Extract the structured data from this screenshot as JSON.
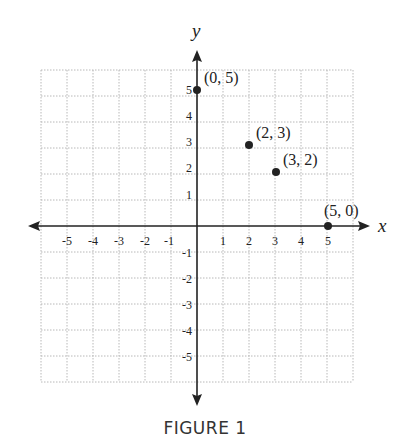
{
  "figure": {
    "caption": "FIGURE 1"
  },
  "axes": {
    "x_label": "x",
    "y_label": "y",
    "x_ticks": [
      "-5",
      "-4",
      "-3",
      "-2",
      "-1",
      "1",
      "2",
      "3",
      "4",
      "5"
    ],
    "y_ticks": [
      "5",
      "4",
      "3",
      "2",
      "1",
      "-1",
      "-2",
      "-3",
      "-4",
      "-5"
    ]
  },
  "points": [
    {
      "label": "(0, 5)",
      "x": 0,
      "y": 5
    },
    {
      "label": "(2, 3)",
      "x": 2,
      "y": 3
    },
    {
      "label": "(3, 2)",
      "x": 3,
      "y": 2
    },
    {
      "label": "(5, 0)",
      "x": 5,
      "y": 0
    }
  ],
  "chart_data": {
    "type": "scatter",
    "title": "FIGURE 1",
    "xlabel": "x",
    "ylabel": "y",
    "xlim": [
      -6,
      6
    ],
    "ylim": [
      -6,
      6
    ],
    "grid": true,
    "x_tick_labels": [
      -5,
      -4,
      -3,
      -2,
      -1,
      1,
      2,
      3,
      4,
      5
    ],
    "y_tick_labels": [
      -5,
      -4,
      -3,
      -2,
      -1,
      1,
      2,
      3,
      4,
      5
    ],
    "series": [
      {
        "name": "points",
        "x": [
          0,
          2,
          3,
          5
        ],
        "y": [
          5,
          3,
          2,
          0
        ],
        "labels": [
          "(0, 5)",
          "(2, 3)",
          "(3, 2)",
          "(5, 0)"
        ]
      }
    ],
    "colors": {
      "axis": "#222222",
      "grid": "#b5b5b5",
      "point": "#222222"
    }
  }
}
